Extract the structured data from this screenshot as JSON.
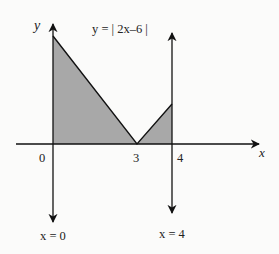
{
  "diagram": {
    "equation_label": "y = | 2x–6 |",
    "axis_labels": {
      "x": "x",
      "y": "y"
    },
    "tick_labels": {
      "origin": "0",
      "three": "3",
      "four": "4"
    },
    "line_labels": {
      "left": "x = 0",
      "right": "x = 4"
    },
    "function": "y = |2x - 6|",
    "shaded_region": "area between y=|2x-6| and x-axis from x=0 to x=4",
    "colors": {
      "fill": "#a8a8a8",
      "stroke": "#111111",
      "background": "#fbfbfa"
    }
  }
}
